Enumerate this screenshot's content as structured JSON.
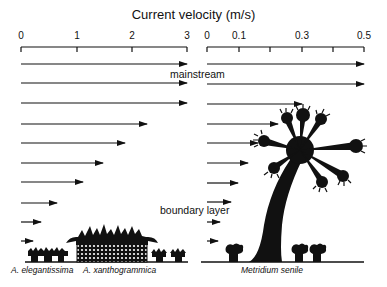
{
  "title": "Current velocity (m/s)",
  "left_axis": {
    "ticks": [
      {
        "label": "0",
        "x": 21
      },
      {
        "label": "1",
        "x": 77
      },
      {
        "label": "2",
        "x": 132
      },
      {
        "label": "3",
        "x": 187
      }
    ],
    "range": [
      0,
      3
    ]
  },
  "right_axis": {
    "ticks": [
      {
        "label": "0",
        "x": 207
      },
      {
        "label": "0.1",
        "x": 239
      },
      {
        "label": "0.3",
        "x": 302
      },
      {
        "label": "0.5",
        "x": 364
      }
    ],
    "minor_ticks_x": [
      270,
      333
    ],
    "range": [
      0,
      0.5
    ]
  },
  "labels": {
    "mainstream": "mainstream",
    "boundary_layer": "boundary layer"
  },
  "species": {
    "left_1": "A. elegantissima",
    "left_2": "A. xanthogrammica",
    "right": "Metridium senile"
  },
  "left_arrows": [
    {
      "y": 64,
      "x2": 187
    },
    {
      "y": 83,
      "x2": 187
    },
    {
      "y": 103,
      "x2": 187
    },
    {
      "y": 124,
      "x2": 147
    },
    {
      "y": 143,
      "x2": 125
    },
    {
      "y": 163,
      "x2": 103
    },
    {
      "y": 182,
      "x2": 83
    },
    {
      "y": 203,
      "x2": 57
    },
    {
      "y": 222,
      "x2": 41
    },
    {
      "y": 241,
      "x2": 33
    }
  ],
  "right_arrows": [
    {
      "y": 64,
      "x2": 364
    },
    {
      "y": 84,
      "x2": 364
    },
    {
      "y": 104,
      "x2": 302
    },
    {
      "y": 124,
      "x2": 278
    },
    {
      "y": 143,
      "x2": 258
    },
    {
      "y": 163,
      "x2": 248
    },
    {
      "y": 183,
      "x2": 238
    },
    {
      "y": 202,
      "x2": 231
    },
    {
      "y": 222,
      "x2": 220
    },
    {
      "y": 241,
      "x2": 218
    }
  ]
}
